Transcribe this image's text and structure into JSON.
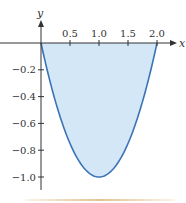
{
  "chart_data": {
    "type": "area",
    "title": "",
    "function": "y = x^2 - 2x",
    "xlabel": "x",
    "ylabel": "y",
    "x_ticks": [
      0.5,
      1.0,
      1.5,
      2.0
    ],
    "x_tick_labels": [
      "0.5",
      "1.0",
      "1.5",
      "2.0"
    ],
    "y_ticks": [
      -0.2,
      -0.4,
      -0.6,
      -0.8,
      -1.0
    ],
    "y_tick_labels": [
      "−0.2",
      "−0.4",
      "−0.6",
      "−0.8",
      "−1.0"
    ],
    "xlim": [
      0,
      2.2
    ],
    "ylim": [
      -1.1,
      0.2
    ],
    "grid": false,
    "legend": null,
    "series": [
      {
        "name": "curve",
        "x": [
          0,
          0.1,
          0.2,
          0.3,
          0.4,
          0.5,
          0.6,
          0.7,
          0.8,
          0.9,
          1.0,
          1.1,
          1.2,
          1.3,
          1.4,
          1.5,
          1.6,
          1.7,
          1.8,
          1.9,
          2.0
        ],
        "values": [
          0,
          -0.19,
          -0.36,
          -0.51,
          -0.64,
          -0.75,
          -0.84,
          -0.91,
          -0.96,
          -0.99,
          -1.0,
          -0.99,
          -0.96,
          -0.91,
          -0.84,
          -0.75,
          -0.64,
          -0.51,
          -0.36,
          -0.19,
          0
        ]
      }
    ],
    "shaded_region": "between curve and x-axis for 0 ≤ x ≤ 2",
    "colors": {
      "curve": "#3a73b5",
      "fill": "#d4e7f6",
      "axes": "#333333"
    }
  },
  "axes": {
    "x_label": "x",
    "y_label": "y"
  }
}
